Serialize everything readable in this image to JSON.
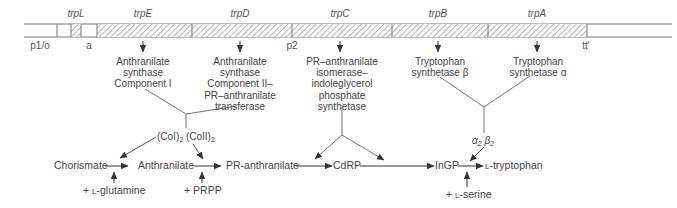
{
  "genes": [
    {
      "name": "trpL",
      "x": 76
    },
    {
      "name": "trpE",
      "x": 143
    },
    {
      "name": "trpD",
      "x": 240
    },
    {
      "name": "trpC",
      "x": 340
    },
    {
      "name": "trpB",
      "x": 438
    },
    {
      "name": "trpA",
      "x": 537
    }
  ],
  "markers": {
    "promoter_operator": "p1/o",
    "attenuator": "a",
    "promoter2": "p2",
    "terminator": "tt'"
  },
  "enzymes": {
    "trpE": [
      "Anthranilate",
      "synthase",
      "Component I"
    ],
    "trpD": [
      "Anthranilate",
      "synthase",
      "Component II–",
      "PR–anthranilate",
      "transferase"
    ],
    "trpC": [
      "PR–anthranilate",
      "isomerase–",
      "indoleglycerol",
      "phosphate",
      "synthetase"
    ],
    "trpB": [
      "Tryptophan",
      "synthetase β"
    ],
    "trpA": [
      "Tryptophan",
      "synthetase α"
    ]
  },
  "complexes": {
    "anthranilate_synthase": {
      "left": "(CoI)",
      "left_sub": "2",
      "right": "(CoII)",
      "right_sub": "2"
    },
    "tryptophan_synthetase": {
      "alpha": "α",
      "alpha_sub": "2",
      "beta": "β",
      "beta_sub": "2"
    }
  },
  "pathway": {
    "chorismate": "Chorismate",
    "anthranilate": "Anthranilate",
    "pr_anthranilate": "PR-anthranilate",
    "cdrp": "CdRP",
    "ingp": "InGP",
    "tryptophan_prefix": "L",
    "tryptophan": "-tryptophan"
  },
  "cosubstrates": {
    "glutamine_plus": "+ ",
    "glutamine_prefix": "L",
    "glutamine": "-glutamine",
    "prpp": "+ PRPP",
    "serine_plus": "+ ",
    "serine_prefix": "L",
    "serine": "-serine"
  }
}
